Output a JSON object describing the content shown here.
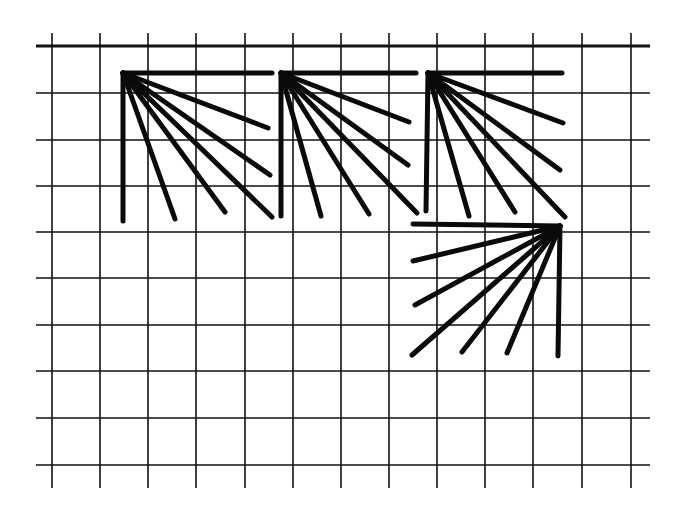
{
  "diagram": {
    "colors": {
      "background": "#ffffff",
      "grid": "#111111",
      "stitch": "#0a0a0a"
    },
    "grid": {
      "vertical_x": [
        52,
        100,
        148,
        196,
        245,
        293,
        341,
        389,
        437,
        485,
        533,
        582,
        631
      ],
      "vertical_y_range": [
        33,
        488
      ],
      "horizontal_y": [
        46,
        93,
        140,
        186,
        232,
        278,
        325,
        371,
        418,
        465
      ],
      "horizontal_x_range": [
        36,
        650
      ],
      "top_line_bold": true
    },
    "fans": [
      {
        "id": "fan-1",
        "origin": [
          123,
          73
        ],
        "rays": [
          [
            272,
            73
          ],
          [
            268,
            128
          ],
          [
            270,
            175
          ],
          [
            272,
            217
          ],
          [
            225,
            212
          ],
          [
            175,
            219
          ],
          [
            123,
            221
          ]
        ]
      },
      {
        "id": "fan-2",
        "origin": [
          281,
          73
        ],
        "rays": [
          [
            416,
            73
          ],
          [
            409,
            122
          ],
          [
            408,
            165
          ],
          [
            417,
            213
          ],
          [
            369,
            214
          ],
          [
            321,
            216
          ],
          [
            281,
            216
          ]
        ]
      },
      {
        "id": "fan-3",
        "origin": [
          428,
          73
        ],
        "rays": [
          [
            562,
            73
          ],
          [
            563,
            123
          ],
          [
            560,
            170
          ],
          [
            565,
            217
          ],
          [
            515,
            212
          ],
          [
            469,
            216
          ],
          [
            426,
            211
          ]
        ]
      },
      {
        "id": "fan-4",
        "origin": [
          560,
          226
        ],
        "rays": [
          [
            413,
            224
          ],
          [
            413,
            261
          ],
          [
            415,
            305
          ],
          [
            412,
            355
          ],
          [
            462,
            352
          ],
          [
            507,
            353
          ],
          [
            558,
            356
          ]
        ]
      }
    ]
  }
}
